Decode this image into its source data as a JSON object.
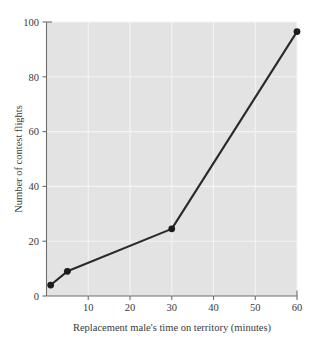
{
  "chart_data": {
    "type": "line",
    "title": "",
    "xlabel": "Replacement male's time on territory (minutes)",
    "ylabel": "Number of contest flights",
    "x": [
      1,
      5,
      30,
      60
    ],
    "values": [
      4,
      9,
      24.5,
      96.5
    ],
    "series": [
      {
        "name": "Number of contest flights",
        "x": [
          1,
          5,
          30,
          60
        ],
        "values": [
          4,
          9,
          24.5,
          96.5
        ]
      }
    ],
    "xlim": [
      0,
      60
    ],
    "ylim": [
      0,
      100
    ],
    "xticks": [
      10,
      20,
      30,
      40,
      50,
      60
    ],
    "yticks": [
      0,
      20,
      40,
      60,
      80,
      100
    ],
    "xtick_labels": [
      "10",
      "20",
      "30",
      "40",
      "50",
      "60"
    ],
    "ytick_labels": [
      "0",
      "20",
      "40",
      "60",
      "80",
      "100"
    ],
    "grid": true,
    "grid_color": "#f4f4f4",
    "legend": false,
    "legend_position": "none",
    "plot_background": "#e3e3e3",
    "figure_background": "#ffffff",
    "line_color": "#2a2a2a",
    "marker_color": "#1c1c1c",
    "marker": "circle",
    "axis_color": "#6e6e6e"
  },
  "axes": {
    "y_title": "Number of contest flights",
    "x_title": "Replacement male's time on territory (minutes)",
    "y_labels": [
      "100",
      "80",
      "60",
      "40",
      "20",
      "0"
    ],
    "x_labels": [
      "10",
      "20",
      "30",
      "40",
      "50",
      "60"
    ]
  }
}
